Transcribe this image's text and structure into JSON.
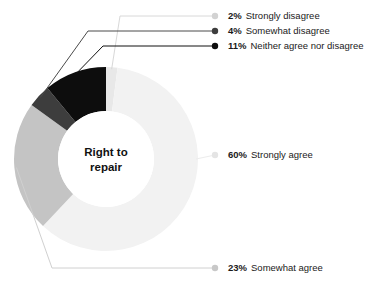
{
  "chart_data": {
    "type": "pie",
    "variant": "donut",
    "title": "",
    "center_label": "Right to\nrepair",
    "center_label_lines": [
      "Right to",
      "repair"
    ],
    "categories": [
      "Strongly disagree",
      "Somewhat disagree",
      "Neither agree nor disagree",
      "Strongly agree",
      "Somewhat agree"
    ],
    "values": [
      2,
      4,
      11,
      60,
      23
    ],
    "value_unit": "%",
    "legend_position": "callout-labels",
    "grid": false,
    "slices": [
      {
        "id": "strongly-disagree",
        "label": "Strongly disagree",
        "pct_text": "2%",
        "value": 2,
        "color": "#e8e8e8",
        "dot_color": "#d2d2d2",
        "line_color": "#d8d8d8",
        "label_x": 228,
        "label_y": 16,
        "dot_x": 215,
        "dot_y": 16
      },
      {
        "id": "somewhat-disagree",
        "label": "Somewhat disagree",
        "pct_text": "4%",
        "value": 4,
        "color": "#3d3d3d",
        "dot_color": "#3d3d3d",
        "line_color": "#4a4a4a",
        "label_x": 228,
        "label_y": 31,
        "dot_x": 215,
        "dot_y": 31
      },
      {
        "id": "neither-agree-nor-disagree",
        "label": "Neither agree nor disagree",
        "pct_text": "11%",
        "value": 11,
        "color": "#0d0d0d",
        "dot_color": "#0d0d0d",
        "line_color": "#111111",
        "label_x": 228,
        "label_y": 46,
        "dot_x": 215,
        "dot_y": 46
      },
      {
        "id": "strongly-agree",
        "label": "Strongly agree",
        "pct_text": "60%",
        "value": 60,
        "color": "#f2f2f2",
        "dot_color": "#e4e4e4",
        "line_color": "#ececec",
        "label_x": 228,
        "label_y": 155,
        "dot_x": 215,
        "dot_y": 155
      },
      {
        "id": "somewhat-agree",
        "label": "Somewhat agree",
        "pct_text": "23%",
        "value": 23,
        "color": "#c4c4c4",
        "dot_color": "#c8c8c8",
        "line_color": "#d0d0d0",
        "label_x": 228,
        "label_y": 268,
        "dot_x": 215,
        "dot_y": 268
      }
    ]
  },
  "geometry": {
    "cx": 106,
    "cy": 159,
    "outer_r": 92,
    "inner_r": 48
  }
}
